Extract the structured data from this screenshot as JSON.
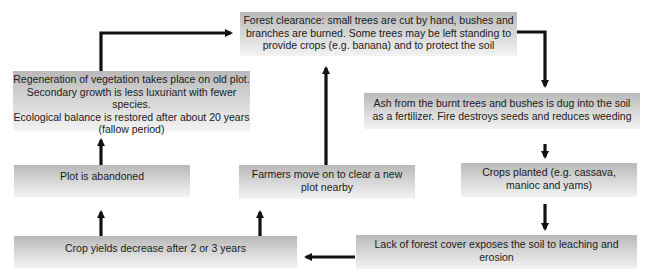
{
  "diagram": {
    "nodes": {
      "forest_clearance": {
        "lines": [
          "Forest clearance: small trees are cut by hand, bushes and",
          "branches are burned. Some trees may be left standing to",
          "provide crops (e.g. banana) and to protect the soil"
        ]
      },
      "ash": {
        "lines": [
          "Ash from the burnt trees and bushes is dug into the soil",
          "as a fertilizer. Fire destroys seeds and reduces weeding"
        ]
      },
      "crops_planted": {
        "lines": [
          "Crops planted (e.g. cassava,",
          "manioc and yams)"
        ]
      },
      "lack_forest_cover": {
        "lines": [
          "Lack of forest cover exposes the soil to leaching and",
          "erosion"
        ]
      },
      "crop_yields": {
        "lines": [
          "Crop yields decrease after 2 or 3 years"
        ]
      },
      "plot_abandoned": {
        "lines": [
          "Plot is abandoned"
        ]
      },
      "farmers_move": {
        "lines": [
          "Farmers move on to clear a new",
          "plot nearby"
        ]
      },
      "regeneration": {
        "lines": [
          "Regeneration of vegetation takes place on old plot.",
          "Secondary growth is less luxuriant with fewer species.",
          "Ecological balance is restored after about 20 years",
          "(fallow period)"
        ]
      }
    },
    "edges": [
      {
        "from": "forest_clearance",
        "to": "ash"
      },
      {
        "from": "ash",
        "to": "crops_planted"
      },
      {
        "from": "crops_planted",
        "to": "lack_forest_cover"
      },
      {
        "from": "lack_forest_cover",
        "to": "crop_yields"
      },
      {
        "from": "crop_yields",
        "to": "plot_abandoned"
      },
      {
        "from": "crop_yields",
        "to": "farmers_move"
      },
      {
        "from": "plot_abandoned",
        "to": "regeneration"
      },
      {
        "from": "farmers_move",
        "to": "forest_clearance"
      },
      {
        "from": "regeneration",
        "to": "forest_clearance"
      }
    ],
    "colors": {
      "box_top": "#b9b9b9",
      "box_bottom": "#f3f3f3",
      "arrow": "#111111"
    }
  }
}
